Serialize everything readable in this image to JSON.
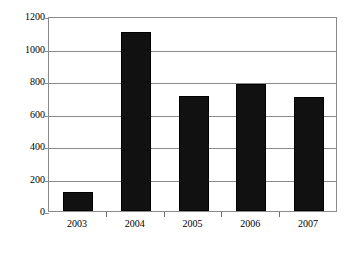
{
  "chart_data": {
    "type": "bar",
    "title": "",
    "subtitle": "",
    "xlabel": "",
    "ylabel": "",
    "categories": [
      "2003",
      "2004",
      "2005",
      "2006",
      "2007"
    ],
    "values": [
      120,
      1100,
      710,
      780,
      700
    ],
    "series": [
      {
        "name": "",
        "values": [
          120,
          1100,
          710,
          780,
          700
        ]
      }
    ],
    "ylim": [
      0,
      1200
    ],
    "ytick_labels": [
      "0",
      "200",
      "400",
      "600",
      "800",
      "1000",
      "1200"
    ],
    "ytick_values": [
      0,
      200,
      400,
      600,
      800,
      1000,
      1200
    ],
    "grid": true,
    "grid_axis": "y",
    "legend": false,
    "legend_position": "none",
    "bar_color": "#111111",
    "grid_color": "#8a8a8a",
    "axis_color": "#8a8a8a",
    "background_color": "#ffffff",
    "annotations": []
  }
}
